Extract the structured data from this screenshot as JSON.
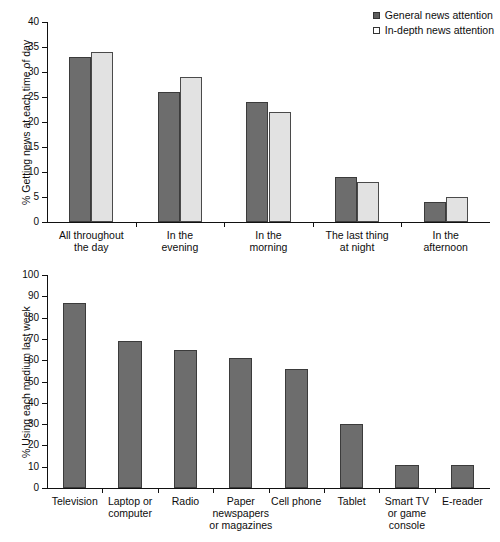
{
  "charts": {
    "top": {
      "ylabel": "% Getting news at each time of day",
      "legend": [
        {
          "label": "General news attention",
          "swatch": "dark-square-icon",
          "color": "#6d6d6d"
        },
        {
          "label": "In-depth news attention",
          "swatch": "light-square-icon",
          "color": "#e2e2e2"
        }
      ]
    },
    "bottom": {
      "ylabel": "% Using each medium last week"
    }
  },
  "chart_data": [
    {
      "type": "bar",
      "title": "",
      "xlabel": "",
      "ylabel": "% Getting news at each time of day",
      "ylim": [
        0,
        40
      ],
      "yticks": [
        0,
        5,
        10,
        15,
        20,
        25,
        30,
        35,
        40
      ],
      "grid": false,
      "legend_position": "top-right",
      "categories": [
        "All throughout\nthe day",
        "In the\nevening",
        "In the\nmorning",
        "The last thing\nat night",
        "In the\nafternoon"
      ],
      "series": [
        {
          "name": "General news attention",
          "color": "#6d6d6d",
          "values": [
            33,
            26,
            24,
            9,
            4
          ]
        },
        {
          "name": "In-depth news attention",
          "color": "#e2e2e2",
          "values": [
            34,
            29,
            22,
            8,
            5
          ]
        }
      ]
    },
    {
      "type": "bar",
      "title": "",
      "xlabel": "",
      "ylabel": "% Using each medium last week",
      "ylim": [
        0,
        100
      ],
      "yticks": [
        0,
        10,
        20,
        30,
        40,
        50,
        60,
        70,
        80,
        90,
        100
      ],
      "grid": false,
      "legend_position": "none",
      "categories": [
        "Television",
        "Laptop or\ncomputer",
        "Radio",
        "Paper\nnewspapers\nor magazines",
        "Cell phone",
        "Tablet",
        "Smart TV\nor game\nconsole",
        "E-reader"
      ],
      "series": [
        {
          "name": "Using each medium last week",
          "color": "#6d6d6d",
          "values": [
            87,
            69,
            65,
            61,
            56,
            30,
            11,
            11
          ]
        }
      ]
    }
  ]
}
